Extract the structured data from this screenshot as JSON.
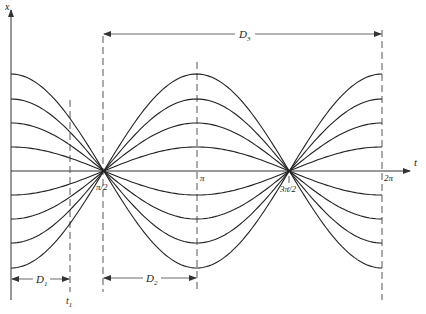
{
  "diagram": {
    "axes": {
      "x_label": "t",
      "y_label": "x"
    },
    "tick_labels": {
      "pi_half": "π/2",
      "pi": "π",
      "three_pi_half": "3π/2",
      "two_pi": "2π",
      "t1": "t",
      "t1_sub": "1"
    },
    "dimensions": {
      "D1": {
        "label": "D",
        "sub": "1"
      },
      "D2": {
        "label": "D",
        "sub": "2"
      },
      "D3": {
        "label": "D",
        "sub": "3"
      }
    },
    "curve_amplitudes_px": [
      97,
      72,
      48,
      24,
      0,
      -24,
      -48,
      -72,
      -97
    ],
    "colors": {
      "ink": "#222222",
      "background": "#ffffff"
    }
  }
}
